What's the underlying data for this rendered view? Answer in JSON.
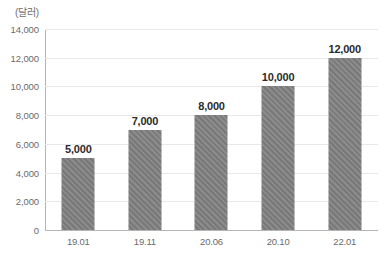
{
  "chart_data": {
    "type": "bar",
    "title": "",
    "subtitle": "",
    "unit_label": "(달러)",
    "xlabel": "",
    "ylabel": "",
    "categories": [
      "19.01",
      "19.11",
      "20.06",
      "20.10",
      "22.01"
    ],
    "values": [
      5000,
      7000,
      8000,
      10000,
      12000
    ],
    "value_labels": [
      "5,000",
      "7,000",
      "8,000",
      "10,000",
      "12,000"
    ],
    "ylim": [
      0,
      14000
    ],
    "ytick_values": [
      0,
      2000,
      4000,
      6000,
      8000,
      10000,
      12000,
      14000
    ],
    "ytick_labels": [
      "0",
      "2,000",
      "4,000",
      "6,000",
      "8,000",
      "10,000",
      "12,000",
      "14,000"
    ],
    "grid": "horizontal",
    "legend": "none",
    "series": [
      {
        "name": "",
        "values": [
          5000,
          7000,
          8000,
          10000,
          12000
        ]
      }
    ],
    "colors": {
      "bar_fill": "#808080",
      "gridline": "#e8e8e8",
      "axis_line": "#b5b5b5",
      "tick_text": "#6b6b6b",
      "value_text": "#2b2b2b",
      "background": "#ffffff"
    }
  }
}
